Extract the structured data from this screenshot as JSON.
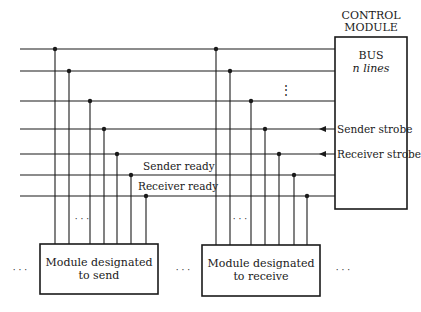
{
  "control_module": {
    "title_line1": "CONTROL",
    "title_line2": "MODULE",
    "bus_label": "BUS",
    "bus_lines_label": "n lines"
  },
  "signals": {
    "sender_strobe": "Sender strobe",
    "receiver_strobe": "Receiver strobe",
    "sender_ready": "Sender ready",
    "receiver_ready": "Receiver ready"
  },
  "modules": {
    "sender": {
      "line1": "Module designated",
      "line2": "to send"
    },
    "receiver": {
      "line1": "Module designated",
      "line2": "to receive"
    }
  },
  "ellipsis": "· · ·",
  "vertical_ellipsis": "⋮"
}
